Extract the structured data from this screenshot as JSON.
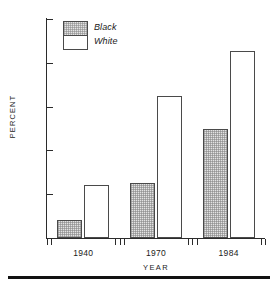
{
  "chart_data": {
    "type": "bar",
    "title": "",
    "subtitle": "",
    "xlabel": "YEAR",
    "ylabel": "PERCENT",
    "categories": [
      "1940",
      "1970",
      "1984"
    ],
    "series": [
      {
        "name": "Black",
        "values": [
          2.1,
          6.3,
          12.4
        ],
        "fill": "#e3e3e3",
        "pattern": "stipple"
      },
      {
        "name": "White",
        "values": [
          6.0,
          16.2,
          21.4
        ],
        "fill": "#ffffff",
        "pattern": "none"
      }
    ],
    "ylim": [
      0,
      25
    ],
    "ytick_values": [
      0,
      5,
      10,
      15,
      20,
      25
    ],
    "ytick_labels": [
      "0",
      "5",
      "10",
      "15",
      "20",
      "25"
    ],
    "grid": false,
    "legend_position": "top-left",
    "legend_style": "stacked-box-italic",
    "axis_color": "#2b2b2b",
    "bar_border_color": "#4a4a4a",
    "background": "#ffffff"
  },
  "figure": {
    "ylabel": "PERCENT",
    "xlabel": "YEAR"
  },
  "legend": {
    "entries": [
      {
        "label": "Black"
      },
      {
        "label": "White"
      }
    ]
  }
}
